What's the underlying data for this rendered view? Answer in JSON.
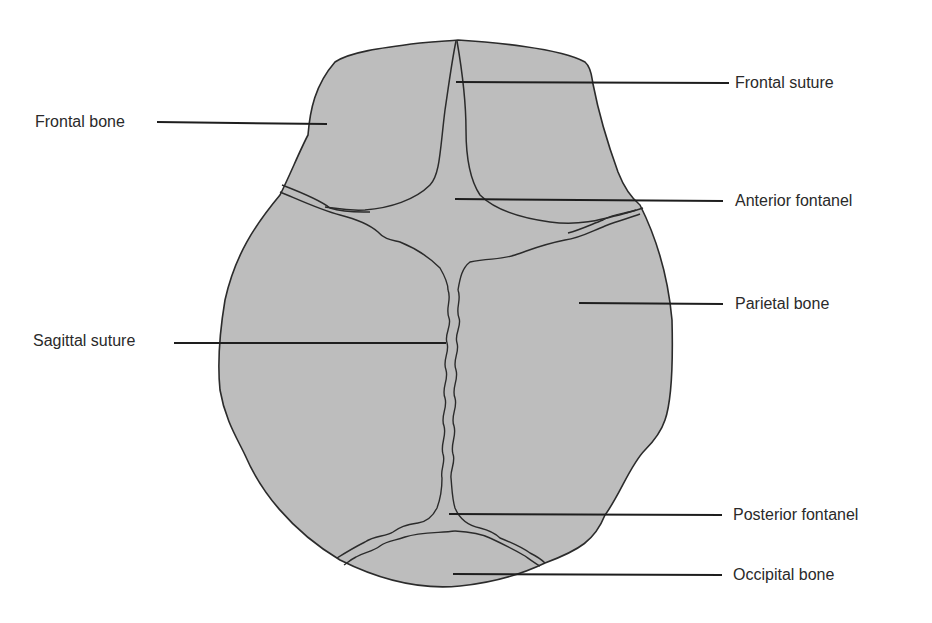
{
  "diagram": {
    "colors": {
      "bone_fill": "#bdbdbd",
      "outline": "#2b2b2b",
      "leader": "#1e1e1e",
      "text": "#2a2a2a",
      "background": "#ffffff"
    },
    "labels": [
      {
        "id": "frontal-suture",
        "text": "Frontal suture",
        "side": "right",
        "text_x": 735,
        "text_y": 74,
        "line": [
          456,
          82,
          729,
          83
        ]
      },
      {
        "id": "frontal-bone",
        "text": "Frontal bone",
        "side": "left",
        "text_x": 35,
        "text_y": 113,
        "line": [
          157,
          122,
          327,
          124
        ]
      },
      {
        "id": "anterior-fontanel",
        "text": "Anterior fontanel",
        "side": "right",
        "text_x": 735,
        "text_y": 192,
        "line": [
          455,
          199,
          723,
          201
        ]
      },
      {
        "id": "parietal-bone",
        "text": "Parietal bone",
        "side": "right",
        "text_x": 735,
        "text_y": 295,
        "line": [
          579,
          303,
          723,
          304
        ]
      },
      {
        "id": "sagittal-suture",
        "text": "Sagittal suture",
        "side": "left",
        "text_x": 33,
        "text_y": 332,
        "line": [
          174,
          343,
          446,
          343
        ]
      },
      {
        "id": "posterior-fontanel",
        "text": "Posterior fontanel",
        "side": "right",
        "text_x": 733,
        "text_y": 506,
        "line": [
          449,
          514,
          722,
          515
        ]
      },
      {
        "id": "occipital-bone",
        "text": "Occipital bone",
        "side": "right",
        "text_x": 733,
        "text_y": 566,
        "line": [
          453,
          574,
          722,
          575
        ]
      }
    ]
  }
}
